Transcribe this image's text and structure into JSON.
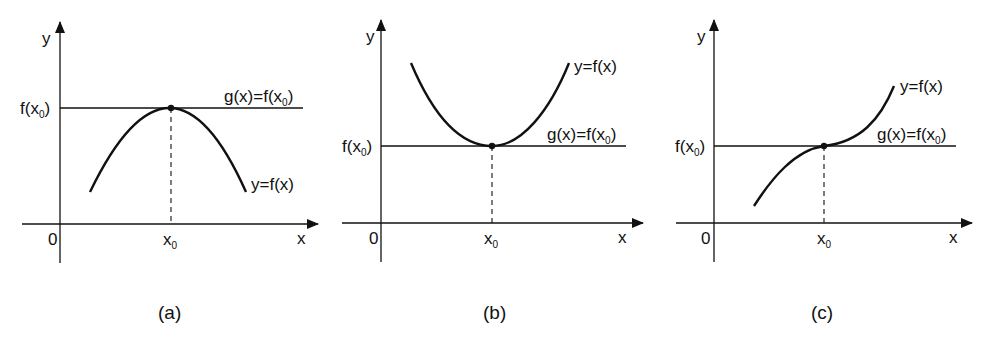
{
  "figure": {
    "panels": [
      {
        "id": "a",
        "caption": "(a)",
        "case": "local maximum",
        "axis_y_label": "y",
        "axis_x_label": "x",
        "origin_label": "0",
        "x0_label": "x",
        "x0_sub": "0",
        "fx0_label_pre": "f(x",
        "fx0_label_sub": "0",
        "fx0_label_post": ")",
        "tangent_label_pre": "g(x)=f(x",
        "tangent_label_sub": "0",
        "tangent_label_post": ")",
        "curve_label": "y=f(x)"
      },
      {
        "id": "b",
        "caption": "(b)",
        "case": "local minimum",
        "axis_y_label": "y",
        "axis_x_label": "x",
        "origin_label": "0",
        "x0_label": "x",
        "x0_sub": "0",
        "fx0_label_pre": "f(x",
        "fx0_label_sub": "0",
        "fx0_label_post": ")",
        "tangent_label_pre": "g(x)=f(x",
        "tangent_label_sub": "0",
        "tangent_label_post": ")",
        "curve_label": "y=f(x)"
      },
      {
        "id": "c",
        "caption": "(c)",
        "case": "horizontal inflection point",
        "axis_y_label": "y",
        "axis_x_label": "x",
        "origin_label": "0",
        "x0_label": "x",
        "x0_sub": "0",
        "fx0_label_pre": "f(x",
        "fx0_label_sub": "0",
        "fx0_label_post": ")",
        "tangent_label_pre": "g(x)=f(x",
        "tangent_label_sub": "0",
        "tangent_label_post": ")",
        "curve_label": "y=f(x)"
      }
    ],
    "colors": {
      "ink": "#111111",
      "background": "#ffffff"
    }
  }
}
